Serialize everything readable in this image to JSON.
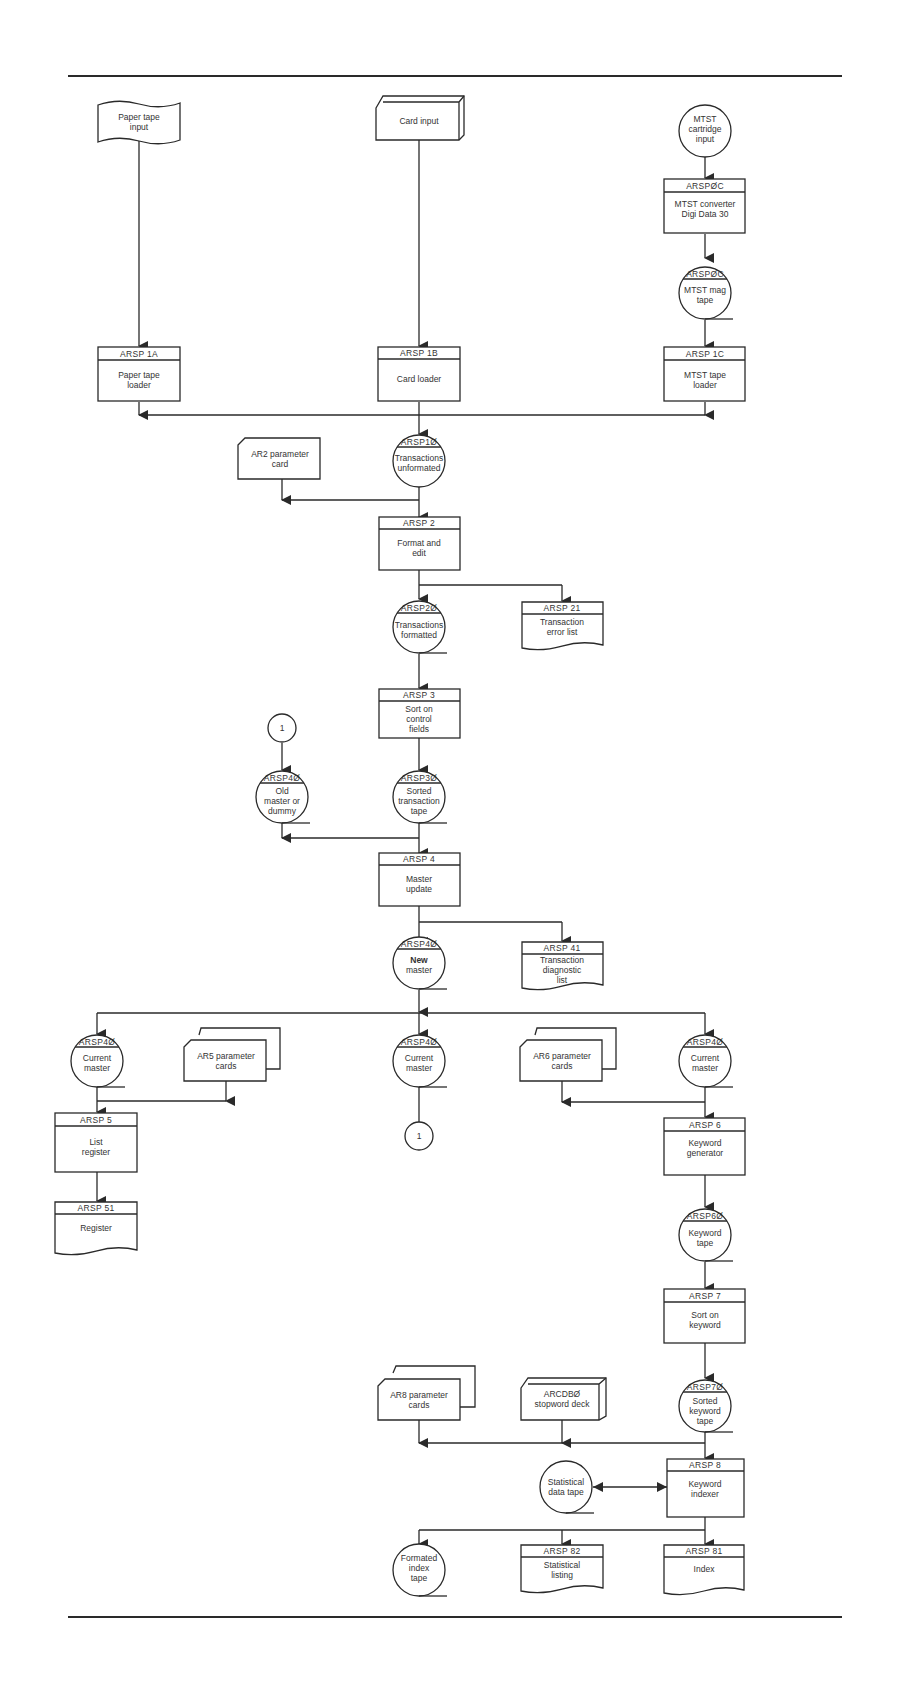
{
  "diagram": {
    "type": "system-flowchart",
    "nodes": {
      "paper_tape_input": {
        "shape": "punched-tape",
        "id": "",
        "label": [
          "Paper tape",
          "input"
        ]
      },
      "card_input": {
        "shape": "card-deck",
        "id": "",
        "label": [
          "Card input"
        ]
      },
      "mtst_cartridge_input": {
        "shape": "circle",
        "id": "",
        "label": [
          "MTST",
          "cartridge",
          "input"
        ]
      },
      "arsp0c_converter": {
        "shape": "process",
        "id": "ARSPØC",
        "label": [
          "MTST converter",
          "Digi Data 30"
        ]
      },
      "arsp0c_tape": {
        "shape": "tape",
        "id": "ARSPØC",
        "label": [
          "MTST mag",
          "tape"
        ]
      },
      "arsp1a": {
        "shape": "process",
        "id": "ARSP 1A",
        "label": [
          "Paper tape",
          "loader"
        ]
      },
      "arsp1b": {
        "shape": "process",
        "id": "ARSP 1B",
        "label": [
          "Card loader"
        ]
      },
      "arsp1c": {
        "shape": "process",
        "id": "ARSP 1C",
        "label": [
          "MTST tape",
          "loader"
        ]
      },
      "ar2_card": {
        "shape": "card",
        "id": "",
        "label": [
          "AR2 parameter",
          "card"
        ]
      },
      "arsp10": {
        "shape": "tape",
        "id": "ARSP1Ø",
        "label": [
          "Transactions",
          "unformated"
        ]
      },
      "arsp2": {
        "shape": "process",
        "id": "ARSP 2",
        "label": [
          "Format and",
          "edit"
        ]
      },
      "arsp20": {
        "shape": "tape",
        "id": "ARSP2Ø",
        "label": [
          "Transactions",
          "formatted"
        ]
      },
      "arsp21": {
        "shape": "document",
        "id": "ARSP 21",
        "label": [
          "Transaction",
          "error list"
        ]
      },
      "arsp3": {
        "shape": "process",
        "id": "ARSP 3",
        "label": [
          "Sort on",
          "control",
          "fields"
        ]
      },
      "connector_1_top": {
        "shape": "connector",
        "id": "",
        "label": [
          "1"
        ]
      },
      "arsp40_old": {
        "shape": "tape",
        "id": "ARSP4Ø",
        "label": [
          "Old",
          "master or",
          "dummy"
        ]
      },
      "arsp30": {
        "shape": "tape",
        "id": "ARSP3Ø",
        "label": [
          "Sorted",
          "transaction",
          "tape"
        ]
      },
      "arsp4": {
        "shape": "process",
        "id": "ARSP 4",
        "label": [
          "Master",
          "update"
        ]
      },
      "arsp40_new": {
        "shape": "tape",
        "id": "ARSP4Ø",
        "label": [
          "New",
          "master"
        ]
      },
      "arsp41": {
        "shape": "document",
        "id": "ARSP 41",
        "label": [
          "Transaction",
          "diagnostic",
          "list"
        ]
      },
      "arsp40_cur_left": {
        "shape": "tape",
        "id": "ARSP4Ø",
        "label": [
          "Current",
          "master"
        ]
      },
      "ar5_cards": {
        "shape": "cards",
        "id": "",
        "label": [
          "AR5 parameter",
          "cards"
        ]
      },
      "arsp40_cur_mid": {
        "shape": "tape",
        "id": "ARSP4Ø",
        "label": [
          "Current",
          "master"
        ]
      },
      "ar6_cards": {
        "shape": "cards",
        "id": "",
        "label": [
          "AR6 parameter",
          "cards"
        ]
      },
      "arsp40_cur_right": {
        "shape": "tape",
        "id": "ARSP4Ø",
        "label": [
          "Current",
          "master"
        ]
      },
      "connector_1_bottom": {
        "shape": "connector",
        "id": "",
        "label": [
          "1"
        ]
      },
      "arsp5": {
        "shape": "process",
        "id": "ARSP 5",
        "label": [
          "List",
          "register"
        ]
      },
      "arsp51": {
        "shape": "document",
        "id": "ARSP 51",
        "label": [
          "Register"
        ]
      },
      "arsp6": {
        "shape": "process",
        "id": "ARSP 6",
        "label": [
          "Keyword",
          "generator"
        ]
      },
      "arsp60": {
        "shape": "tape",
        "id": "ARSP6Ø",
        "label": [
          "Keyword",
          "tape"
        ]
      },
      "arsp7": {
        "shape": "process",
        "id": "ARSP 7",
        "label": [
          "Sort on",
          "keyword"
        ]
      },
      "arsp70": {
        "shape": "tape",
        "id": "ARSP7Ø",
        "label": [
          "Sorted",
          "keyword",
          "tape"
        ]
      },
      "ar8_cards": {
        "shape": "cards",
        "id": "",
        "label": [
          "AR8 parameter",
          "cards"
        ]
      },
      "arcdb0_deck": {
        "shape": "card-deck",
        "id": "",
        "label": [
          "ARCDBØ",
          "stopword deck"
        ]
      },
      "stat_tape": {
        "shape": "tape",
        "id": "",
        "label": [
          "Statistical",
          "data tape"
        ]
      },
      "arsp8": {
        "shape": "process",
        "id": "ARSP 8",
        "label": [
          "Keyword",
          "indexer"
        ]
      },
      "formated_index_tape": {
        "shape": "tape",
        "id": "",
        "label": [
          "Formated",
          "index",
          "tape"
        ]
      },
      "arsp82": {
        "shape": "document",
        "id": "ARSP 82",
        "label": [
          "Statistical",
          "listing"
        ]
      },
      "arsp81": {
        "shape": "document",
        "id": "ARSP 81",
        "label": [
          "Index"
        ]
      }
    }
  }
}
